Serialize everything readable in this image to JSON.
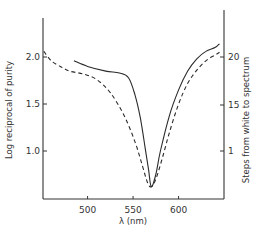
{
  "chart_data": {
    "type": "line",
    "title": "",
    "xlabel": "λ (nm)",
    "ylabel": "Log reciprocal of purity",
    "ylabel_right": "Steps from white to spectrum",
    "xlim": [
      451,
      650
    ],
    "ylim": [
      0.6,
      2.4
    ],
    "x_ticks": [
      500,
      550,
      600
    ],
    "x_tick_labels": [
      "500",
      "550",
      "600"
    ],
    "y_ticks": [
      1.0,
      1.5,
      2.0
    ],
    "y_tick_labels": [
      "1.0",
      "1.5",
      "2.0"
    ],
    "y_right_ticks": [
      1,
      15,
      20
    ],
    "y_right_tick_labels": [
      "1",
      "15",
      "20"
    ],
    "grid": false,
    "legend": null,
    "series": [
      {
        "name": "Log reciprocal of purity",
        "style": "solid",
        "x": [
          485,
          500,
          520,
          535,
          545,
          552,
          558,
          563,
          567,
          570,
          575,
          580,
          590,
          600,
          610,
          620,
          630,
          640,
          645
        ],
        "y": [
          1.96,
          1.9,
          1.85,
          1.83,
          1.78,
          1.6,
          1.35,
          1.05,
          0.8,
          0.62,
          0.75,
          1.0,
          1.38,
          1.65,
          1.85,
          1.98,
          2.06,
          2.1,
          2.14
        ]
      },
      {
        "name": "Steps from white to spectrum",
        "style": "dashed",
        "x": [
          452,
          460,
          470,
          480,
          495,
          510,
          525,
          540,
          552,
          560,
          566,
          570,
          575,
          582,
          590,
          600,
          610,
          620,
          630,
          640,
          645
        ],
        "y": [
          2.06,
          1.96,
          1.9,
          1.85,
          1.82,
          1.76,
          1.62,
          1.38,
          1.1,
          0.85,
          0.66,
          0.62,
          0.7,
          0.92,
          1.2,
          1.5,
          1.72,
          1.86,
          1.96,
          2.02,
          2.05
        ]
      }
    ]
  }
}
